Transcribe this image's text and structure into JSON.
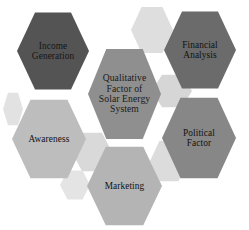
{
  "diagram": {
    "type": "hexagon-cluster",
    "background_color": "#ffffff",
    "center": {
      "id": "center",
      "label": "Qualitative\nFactor of\nSolar Energy\nSystem",
      "fill_color": "#8f8f8f",
      "text_color": "#1a1a1a"
    },
    "nodes": [
      {
        "id": "income-generation",
        "label": "Income\nGeneration",
        "fill_color": "#545454",
        "text_color": "#151515",
        "position": "top-left"
      },
      {
        "id": "financial-analysis",
        "label": "Financial\nAnalysis",
        "fill_color": "#6b6b6b",
        "text_color": "#111111",
        "position": "top-right"
      },
      {
        "id": "political-factor",
        "label": "Political\nFactor",
        "fill_color": "#878787",
        "text_color": "#111111",
        "position": "bottom-right"
      },
      {
        "id": "marketing",
        "label": "Marketing",
        "fill_color": "#b4b4b4",
        "text_color": "#111111",
        "position": "bottom"
      },
      {
        "id": "awareness",
        "label": "Awareness",
        "fill_color": "#bdbdbd",
        "text_color": "#111111",
        "position": "bottom-left"
      }
    ],
    "decorative_shadows": [
      {
        "id": "ghost-top",
        "fill_color": "#dedede"
      },
      {
        "id": "ghost-upper-right",
        "fill_color": "#d6d6d6"
      },
      {
        "id": "ghost-left-mid",
        "fill_color": "#e2e2e2"
      },
      {
        "id": "ghost-mid-left",
        "fill_color": "#d9d9d9"
      },
      {
        "id": "ghost-mid-right",
        "fill_color": "#dcdcdc"
      },
      {
        "id": "ghost-bottom-left",
        "fill_color": "#e4e4e4"
      }
    ]
  }
}
